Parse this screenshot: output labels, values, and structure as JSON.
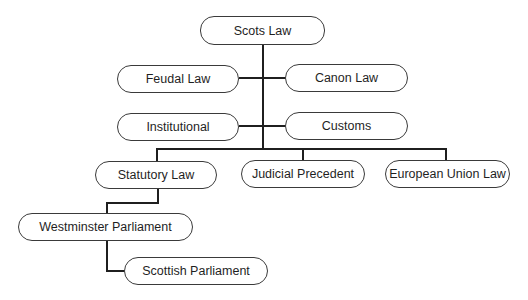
{
  "diagram": {
    "root": {
      "label": "Scots Law"
    },
    "historical_sources": [
      {
        "label": "Feudal Law",
        "side": "left"
      },
      {
        "label": "Canon Law",
        "side": "right"
      },
      {
        "label": "Institutional",
        "side": "left"
      },
      {
        "label": "Customs",
        "side": "right"
      }
    ],
    "main_sources": [
      {
        "label": "Statutory Law"
      },
      {
        "label": "Judicial Precedent"
      },
      {
        "label": "European Union Law"
      }
    ],
    "statutory_children": [
      {
        "label": "Westminster Parliament"
      },
      {
        "label": "Scottish Parliament"
      }
    ],
    "colors": {
      "background": "#ffffff",
      "line": "#1f1f1f",
      "node_border": "#3a3a3a",
      "text": "#1f1f1f"
    }
  }
}
